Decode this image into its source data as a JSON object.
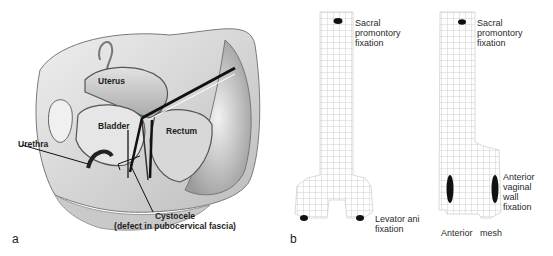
{
  "panel_a": {
    "letter": "a",
    "labels": {
      "uterus": "Uterus",
      "bladder": "Bladder",
      "rectum": "Rectum",
      "urethra": "Urethra",
      "cystocele_line1": "Cystocele",
      "cystocele_line2": "(defect in pubocervical fascia)"
    }
  },
  "panel_b": {
    "letter": "b",
    "left_mesh": {
      "top_label": [
        "Sacral",
        "promontory",
        "fixation"
      ],
      "bottom_label": [
        "Levator ani",
        "fixation"
      ]
    },
    "right_mesh": {
      "top_label": [
        "Sacral",
        "promontory",
        "fixation"
      ],
      "side_label": [
        "Anterior",
        "vaginal",
        "wall",
        "fixation"
      ],
      "caption": "Anterior   mesh"
    }
  },
  "colors": {
    "mesh_grid": "#c8c8c8",
    "fixation_dot": "#111111",
    "text": "#2a2a2a"
  }
}
